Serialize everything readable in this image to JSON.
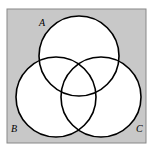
{
  "diagram": {
    "type": "venn",
    "background_color": "#c8c8c8",
    "circle_fill": "#ffffff",
    "stroke_color": "#000000",
    "sets": [
      {
        "label": "A",
        "cx": 79,
        "cy": 56,
        "r": 40,
        "label_x": 38,
        "label_y": 25
      },
      {
        "label": "B",
        "cx": 56,
        "cy": 97,
        "r": 40,
        "label_x": 11,
        "label_y": 131
      },
      {
        "label": "C",
        "cx": 101,
        "cy": 97,
        "r": 40,
        "label_x": 137,
        "label_y": 131
      }
    ]
  }
}
